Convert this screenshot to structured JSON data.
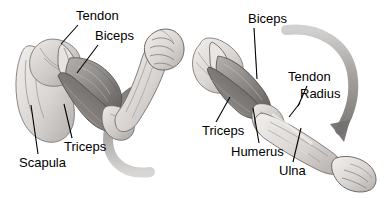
{
  "figure": {
    "background_color": "#ffffff",
    "label_color": "#000000",
    "panels": [
      {
        "name": "flexed-arm",
        "description": "Left panel: arm flexed at elbow with clenched fist, biceps contracted",
        "labels": [
          "Tendon",
          "Biceps",
          "Triceps",
          "Scapula"
        ],
        "motion_arrow": "curved-arrow-up"
      },
      {
        "name": "extended-arm",
        "description": "Right panel: arm extended downward with open hand, triceps contracted",
        "labels": [
          "Biceps",
          "Tendon",
          "Radius",
          "Triceps",
          "Humerus",
          "Ulna"
        ],
        "motion_arrow": "curved-arrow-down"
      }
    ]
  },
  "labels": {
    "left": [
      {
        "id": "tendon-left",
        "text": "Tendon",
        "x": 76,
        "y": 9,
        "leader": {
          "x1": 76,
          "y1": 26,
          "x2": 60,
          "y2": 44
        }
      },
      {
        "id": "biceps-left",
        "text": "Biceps",
        "x": 95,
        "y": 29,
        "leader": {
          "x1": 97,
          "y1": 46,
          "x2": 76,
          "y2": 72
        }
      },
      {
        "id": "triceps-left",
        "text": "Triceps",
        "x": 64,
        "y": 140,
        "leader": {
          "x1": 70,
          "y1": 139,
          "x2": 63,
          "y2": 103
        }
      },
      {
        "id": "scapula-left",
        "text": "Scapula",
        "x": 19,
        "y": 156,
        "leader": {
          "x1": 36,
          "y1": 155,
          "x2": 30,
          "y2": 104
        }
      }
    ],
    "right": [
      {
        "id": "biceps-right",
        "text": "Biceps",
        "x": 248,
        "y": 12,
        "leader": {
          "x1": 253,
          "y1": 29,
          "x2": 256,
          "y2": 78
        }
      },
      {
        "id": "tendon-right",
        "text": "Tendon",
        "x": 288,
        "y": 70,
        "leader": {
          "x1": 306,
          "y1": 87,
          "x2": 297,
          "y2": 106
        }
      },
      {
        "id": "radius-right",
        "text": "Radius",
        "x": 300,
        "y": 87,
        "leader": {
          "x1": 299,
          "y1": 104,
          "x2": 288,
          "y2": 116
        }
      },
      {
        "id": "triceps-right",
        "text": "Triceps",
        "x": 202,
        "y": 124,
        "leader": {
          "x1": 215,
          "y1": 123,
          "x2": 229,
          "y2": 96
        }
      },
      {
        "id": "humerus-right",
        "text": "Humerus",
        "x": 231,
        "y": 145,
        "leader": {
          "x1": 258,
          "y1": 144,
          "x2": 252,
          "y2": 107
        }
      },
      {
        "id": "ulna-right",
        "text": "Ulna",
        "x": 279,
        "y": 164,
        "leader": {
          "x1": 292,
          "y1": 163,
          "x2": 300,
          "y2": 127
        }
      }
    ]
  },
  "arrows": {
    "left": {
      "name": "motion-arrow-up",
      "direction": "up",
      "color": "#8c8c8c"
    },
    "right": {
      "name": "motion-arrow-down",
      "direction": "down",
      "color": "#8c8c8c"
    }
  },
  "colors": {
    "ink": "#000000",
    "background": "#ffffff",
    "skin_light": "#e9e6e3",
    "skin_mid": "#c9c5c2",
    "muscle_dark": "#6e6a68",
    "arrow_gray": "#8c8c8c"
  }
}
